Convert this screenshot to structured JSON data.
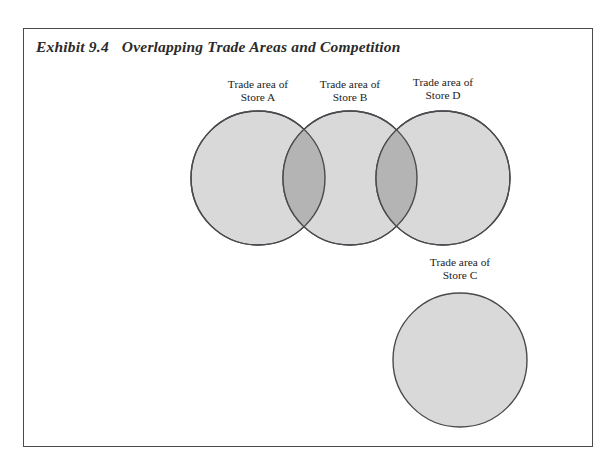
{
  "exhibit": {
    "number": "Exhibit 9.4",
    "title": "Overlapping Trade Areas and Competition"
  },
  "diagram": {
    "type": "venn",
    "fill_color": "#d9d9d9",
    "overlap_color": "#b4b4b4",
    "stroke_color": "#4a4a4f",
    "radius": 67,
    "circles": [
      {
        "id": "A",
        "label_line1": "Trade area of",
        "label_line2": "Store A",
        "cx": 258,
        "cy": 178
      },
      {
        "id": "B",
        "label_line1": "Trade area of",
        "label_line2": "Store B",
        "cx": 350,
        "cy": 178
      },
      {
        "id": "D",
        "label_line1": "Trade area of",
        "label_line2": "Store D",
        "cx": 443,
        "cy": 178
      },
      {
        "id": "C",
        "label_line1": "Trade area of",
        "label_line2": "Store C",
        "cx": 460,
        "cy": 360
      }
    ],
    "overlaps": [
      {
        "between": [
          "A",
          "B"
        ],
        "cx": 317
      },
      {
        "between": [
          "B",
          "D"
        ],
        "cx": 408
      }
    ]
  }
}
